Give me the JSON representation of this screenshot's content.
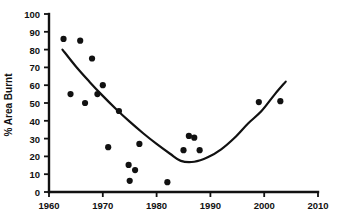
{
  "chart_data": {
    "type": "scatter",
    "title": "",
    "xlabel": "",
    "ylabel": "% Area Burnt",
    "xlim": [
      1960,
      2010
    ],
    "ylim": [
      0,
      100
    ],
    "xticks": [
      1960,
      1970,
      1980,
      1990,
      2000,
      2010
    ],
    "xtick_labels": [
      "1960",
      "1970",
      "1980",
      "1990",
      "2000",
      "2010"
    ],
    "yticks": [
      0,
      10,
      20,
      30,
      40,
      50,
      60,
      70,
      80,
      90,
      100
    ],
    "ytick_labels": [
      "0",
      "10",
      "20",
      "30",
      "40",
      "50",
      "60",
      "70",
      "80",
      "90",
      "100"
    ],
    "grid": false,
    "legend": null,
    "marker": "filled-circle",
    "marker_color": "#111111",
    "series": [
      {
        "name": "Annual % area burnt",
        "x": [
          1962.7,
          1964.0,
          1965.8,
          1966.7,
          1968.0,
          1969.0,
          1970.0,
          1971.0,
          1973.0,
          1974.8,
          1975.0,
          1976.0,
          1976.8,
          1982.0,
          1985.0,
          1986.0,
          1987.0,
          1988.0,
          1999.0,
          2003.0
        ],
        "y": [
          86.0,
          55.0,
          85.0,
          50.0,
          75.0,
          55.0,
          60.0,
          25.2,
          45.5,
          15.2,
          6.3,
          12.3,
          27.0,
          5.5,
          23.5,
          31.5,
          30.5,
          23.5,
          50.5,
          51.0
        ]
      }
    ],
    "fit_curve": {
      "name": "quadratic trend line",
      "color": "#111111",
      "x": [
        1962.5,
        1965.0,
        1967.5,
        1970.0,
        1972.5,
        1975.0,
        1977.5,
        1980.0,
        1982.5,
        1984.5,
        1987.0,
        1989.5,
        1992.0,
        1994.5,
        1997.0,
        1999.5,
        2002.0,
        2004.0
      ],
      "y": [
        80.0,
        70.5,
        62.0,
        54.0,
        46.5,
        39.5,
        33.0,
        27.0,
        21.5,
        17.5,
        17.0,
        19.5,
        24.0,
        30.5,
        38.5,
        45.5,
        55.0,
        62.0
      ]
    }
  },
  "axis": {
    "y_axis_title": "% Area Burnt"
  }
}
